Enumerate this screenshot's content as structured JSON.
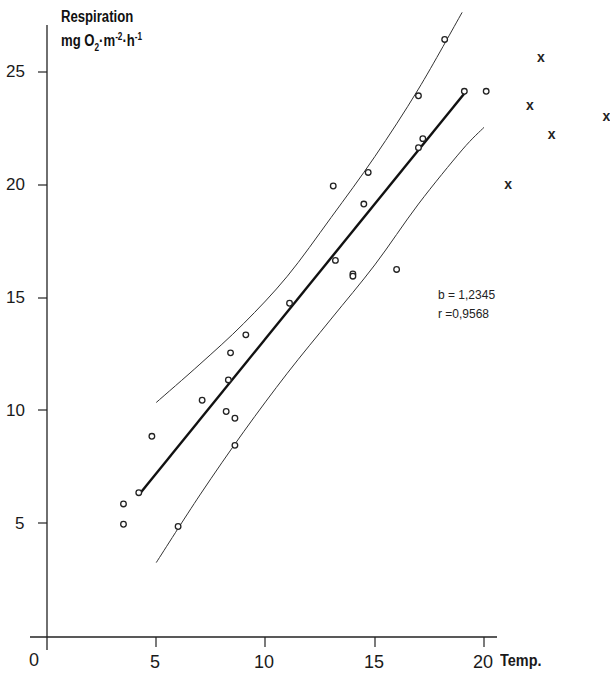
{
  "chart_data": {
    "type": "scatter",
    "title": "Respiration mg O2·m-2·h-1",
    "ylabel_line1": "Respiration",
    "ylabel_line2_parts": {
      "mg": "mg O",
      "sub": "2",
      "m": "·m",
      "sup1": "-2",
      "h": "·h",
      "sup2": "-1"
    },
    "xlabel": "Temp.",
    "xlim": [
      0,
      25
    ],
    "ylim": [
      0,
      27
    ],
    "x_ticks": [
      0,
      5,
      10,
      15,
      20
    ],
    "y_ticks": [
      5,
      10,
      15,
      20,
      25
    ],
    "grid": false,
    "series": [
      {
        "name": "observations (circles)",
        "marker": "o",
        "points": [
          [
            3.5,
            5.0
          ],
          [
            3.5,
            5.9
          ],
          [
            4.2,
            6.4
          ],
          [
            4.8,
            8.9
          ],
          [
            6.0,
            4.9
          ],
          [
            7.1,
            10.5
          ],
          [
            8.2,
            10.0
          ],
          [
            8.3,
            11.4
          ],
          [
            8.4,
            12.6
          ],
          [
            8.6,
            9.7
          ],
          [
            8.6,
            8.5
          ],
          [
            9.1,
            13.4
          ],
          [
            11.1,
            14.8
          ],
          [
            13.1,
            20.0
          ],
          [
            13.2,
            16.7
          ],
          [
            14.0,
            16.1
          ],
          [
            14.0,
            16.0
          ],
          [
            14.5,
            19.2
          ],
          [
            14.7,
            20.6
          ],
          [
            16.0,
            16.3
          ],
          [
            17.0,
            24.0
          ],
          [
            17.0,
            21.7
          ],
          [
            17.2,
            22.1
          ],
          [
            18.2,
            26.5
          ],
          [
            19.1,
            24.2
          ],
          [
            20.1,
            24.2
          ]
        ]
      },
      {
        "name": "excluded (crosses)",
        "marker": "x",
        "points": [
          [
            21.1,
            20.1
          ],
          [
            22.1,
            23.6
          ],
          [
            22.6,
            25.7
          ],
          [
            23.1,
            22.3
          ],
          [
            25.6,
            23.1
          ]
        ]
      }
    ],
    "regression": {
      "x_start": 4.2,
      "x_end": 19.1,
      "y_start": 6.3,
      "y_end": 24.1,
      "slope": 1.2345
    },
    "confidence_upper": [
      [
        5.0,
        10.4
      ],
      [
        7.0,
        12.1
      ],
      [
        9.0,
        13.9
      ],
      [
        11.0,
        16.0
      ],
      [
        13.0,
        18.6
      ],
      [
        15.0,
        21.3
      ],
      [
        17.0,
        24.3
      ],
      [
        19.0,
        27.7
      ]
    ],
    "confidence_lower": [
      [
        5.0,
        3.3
      ],
      [
        7.0,
        6.3
      ],
      [
        9.0,
        9.1
      ],
      [
        11.0,
        11.7
      ],
      [
        13.0,
        14.1
      ],
      [
        15.0,
        16.5
      ],
      [
        17.0,
        19.2
      ],
      [
        19.0,
        21.6
      ],
      [
        20.0,
        22.6
      ]
    ],
    "annotations": {
      "b": "b = 1,2345",
      "r": "r =0,9568"
    }
  },
  "labels": {
    "origin": "0",
    "x5": "5",
    "x10": "10",
    "x15": "15",
    "x20": "20",
    "y5": "5",
    "y10": "10",
    "y15": "15",
    "y20": "20",
    "y25": "25"
  }
}
